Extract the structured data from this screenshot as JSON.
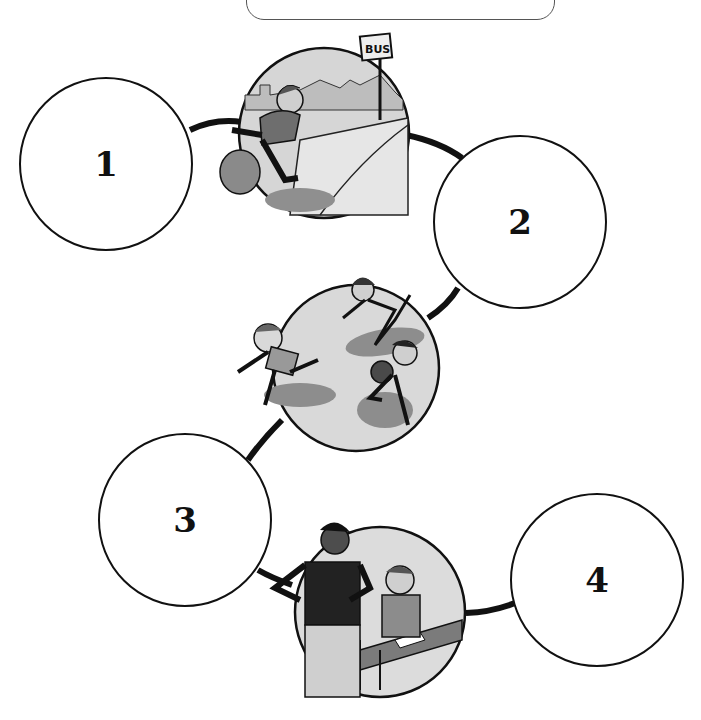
{
  "worksheet": {
    "banner": {
      "visible_text": ""
    },
    "answer_circles": [
      {
        "label": "1",
        "cx": 106,
        "cy": 164,
        "r": 87
      },
      {
        "label": "2",
        "cx": 520,
        "cy": 222,
        "r": 87
      },
      {
        "label": "3",
        "cx": 185,
        "cy": 520,
        "r": 87
      },
      {
        "label": "4",
        "cx": 597,
        "cy": 580,
        "r": 87
      }
    ],
    "pictures": [
      {
        "id": "boy-running-to-bus",
        "description": "Boy with bag rushing toward a bus stop",
        "sign_text": "BUS",
        "cx": 324,
        "cy": 133,
        "r": 86
      },
      {
        "id": "children-running",
        "description": "Three children running",
        "cx": 356,
        "cy": 368,
        "r": 84
      },
      {
        "id": "teacher-and-student",
        "description": "Teacher standing beside a smiling boy writing at a desk",
        "cx": 380,
        "cy": 612,
        "r": 86
      }
    ],
    "colors": {
      "line": "#111111",
      "picture_bg": "#d9d9d9",
      "picture_shadow": "#8a8a8a"
    }
  }
}
